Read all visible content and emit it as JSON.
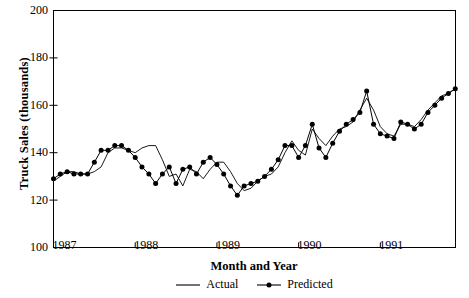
{
  "chart_data": {
    "type": "line",
    "title": "",
    "xlabel": "Month and Year",
    "ylabel": "Truck Sales (thousands)",
    "xlim": [
      1987.0,
      1991.92
    ],
    "ylim": [
      100,
      200
    ],
    "yticks": [
      100,
      120,
      140,
      160,
      180,
      200
    ],
    "xticks": [
      1987,
      1988,
      1989,
      1990,
      1991
    ],
    "xtick_labels": [
      "1987",
      "1988",
      "1989",
      "1990",
      "1991"
    ],
    "ytick_labels": [
      "100",
      "120",
      "140",
      "160",
      "180",
      "200"
    ],
    "grid": false,
    "legend_position": "below",
    "x": [
      1987.0,
      1987.083,
      1987.167,
      1987.25,
      1987.333,
      1987.417,
      1987.5,
      1987.583,
      1987.667,
      1987.75,
      1987.833,
      1987.917,
      1988.0,
      1988.083,
      1988.167,
      1988.25,
      1988.333,
      1988.417,
      1988.5,
      1988.583,
      1988.667,
      1988.75,
      1988.833,
      1988.917,
      1989.0,
      1989.083,
      1989.167,
      1989.25,
      1989.333,
      1989.417,
      1989.5,
      1989.583,
      1989.667,
      1989.75,
      1989.833,
      1989.917,
      1990.0,
      1990.083,
      1990.167,
      1990.25,
      1990.333,
      1990.417,
      1990.5,
      1990.583,
      1990.667,
      1990.75,
      1990.833,
      1990.917,
      1991.0,
      1991.083,
      1991.167,
      1991.25,
      1991.333,
      1991.417,
      1991.5,
      1991.583,
      1991.667,
      1991.75,
      1991.833,
      1991.917
    ],
    "series": [
      {
        "name": "Actual",
        "marker": "none",
        "color": "#000000",
        "values": [
          128,
          130,
          132,
          132,
          131,
          131,
          132,
          134,
          140,
          142,
          142,
          141,
          140,
          142,
          143,
          143,
          137,
          130,
          131,
          126,
          133,
          132,
          129,
          133,
          136,
          136,
          132,
          127,
          124,
          125,
          128,
          130,
          131,
          134,
          140,
          145,
          141,
          139,
          150,
          146,
          143,
          147,
          150,
          151,
          153,
          158,
          163,
          158,
          151,
          148,
          147,
          152,
          152,
          151,
          154,
          158,
          161,
          164,
          165,
          167
        ]
      },
      {
        "name": "Predicted",
        "marker": "circle",
        "color": "#000000",
        "values": [
          129,
          131,
          132,
          131,
          131,
          131,
          136,
          141,
          141,
          143,
          143,
          141,
          138,
          134,
          131,
          127,
          131,
          134,
          127,
          133,
          134,
          131,
          136,
          138,
          135,
          131,
          126,
          122,
          126,
          127,
          128,
          130,
          133,
          137,
          143,
          143,
          138,
          143,
          152,
          142,
          138,
          144,
          149,
          152,
          154,
          157,
          166,
          152,
          148,
          147,
          146,
          153,
          152,
          150,
          152,
          157,
          160,
          163,
          165,
          167
        ]
      }
    ]
  },
  "legend": {
    "items": [
      {
        "label": "Actual",
        "style": "line"
      },
      {
        "label": "Predicted",
        "style": "line-marker"
      }
    ]
  }
}
